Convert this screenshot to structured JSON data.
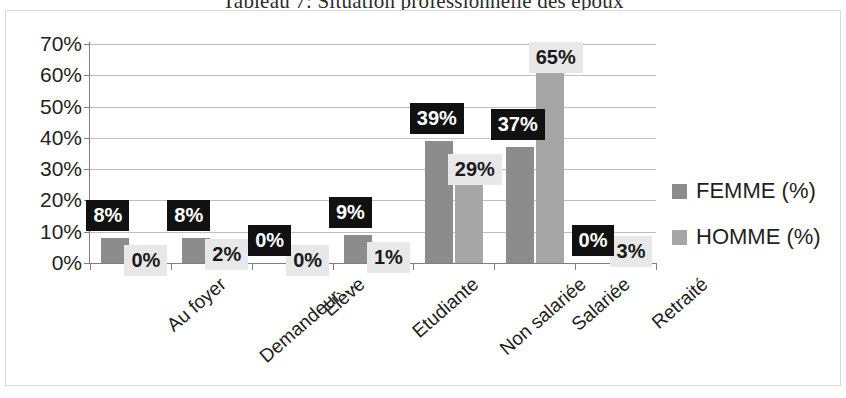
{
  "document": {
    "title": "Tableau 7: Situation professionnelle des époux"
  },
  "legend": {
    "position": "right",
    "items": [
      {
        "label": "FEMME (%)",
        "color": "#8c8c8c",
        "swatch": "legend-swatch-femme"
      },
      {
        "label": "HOMME (%)",
        "color": "#a6a6a6",
        "swatch": "legend-swatch-homme"
      }
    ]
  },
  "axes": {
    "y_ticks": [
      "70%",
      "60%",
      "50%",
      "40%",
      "30%",
      "20%",
      "10%",
      "0%"
    ],
    "y_min": 0,
    "y_max": 70,
    "y_step": 10,
    "grid": true
  },
  "chart_data": {
    "type": "bar",
    "title": "Tableau 7: Situation professionnelle des époux",
    "xlabel": "",
    "ylabel": "",
    "ylim": [
      0,
      70
    ],
    "ytick_labels": [
      "0%",
      "10%",
      "20%",
      "30%",
      "40%",
      "50%",
      "60%",
      "70%"
    ],
    "grid": true,
    "legend_position": "right",
    "categories": [
      "Au foyer",
      "Demandeur…",
      "Elève",
      "Etudiante",
      "Non salariée",
      "Salariée",
      "Retraité"
    ],
    "series": [
      {
        "name": "FEMME (%)",
        "color": "#8c8c8c",
        "values": [
          8,
          8,
          0,
          9,
          39,
          37,
          0
        ],
        "labels": [
          "8%",
          "8%",
          "0%",
          "9%",
          "39%",
          "37%",
          "0%"
        ]
      },
      {
        "name": "HOMME (%)",
        "color": "#a6a6a6",
        "values": [
          0,
          2,
          0,
          1,
          29,
          65,
          3
        ],
        "labels": [
          "0%",
          "2%",
          "0%",
          "1%",
          "29%",
          "65%",
          "3%"
        ]
      }
    ]
  }
}
